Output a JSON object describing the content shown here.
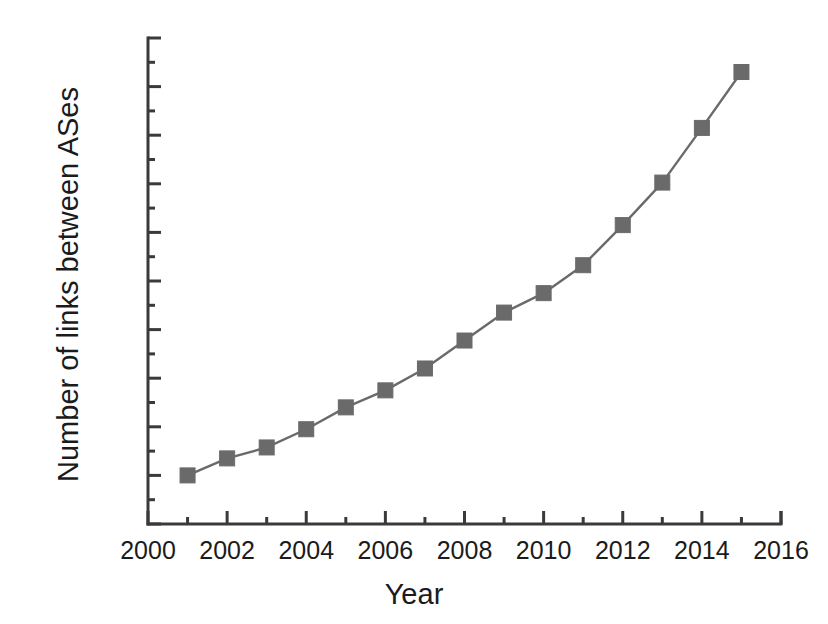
{
  "chart_data": {
    "type": "line",
    "title": "",
    "xlabel": "Year",
    "ylabel": "Number of links between ASes",
    "x": [
      2001,
      2002,
      2003,
      2004,
      2005,
      2006,
      2007,
      2008,
      2009,
      2010,
      2011,
      2012,
      2013,
      2014,
      2015
    ],
    "values": [
      20000,
      27000,
      31500,
      39000,
      48000,
      55000,
      64000,
      75500,
      87000,
      95000,
      106500,
      123000,
      140500,
      163000,
      186000
    ],
    "series": [
      {
        "name": "Number of links between ASes",
        "marker": "square",
        "marker_color": "#6a6a6a",
        "line_color": "#6a6a6a",
        "values": [
          20000,
          27000,
          31500,
          39000,
          48000,
          55000,
          64000,
          75500,
          87000,
          95000,
          106500,
          123000,
          140500,
          163000,
          186000
        ]
      }
    ],
    "xlim": [
      2000,
      2016
    ],
    "ylim": [
      0,
      200000
    ],
    "xticks": [
      2000,
      2002,
      2004,
      2006,
      2008,
      2010,
      2012,
      2014,
      2016
    ],
    "xtick_labels": [
      "2000",
      "2002",
      "2004",
      "2006",
      "2008",
      "2010",
      "2012",
      "2014",
      "2016"
    ],
    "xminor_ticks": [
      2001,
      2003,
      2005,
      2007,
      2009,
      2011,
      2013,
      2015
    ],
    "yticks": [
      0,
      20000,
      40000,
      60000,
      80000,
      100000,
      120000,
      140000,
      160000,
      180000,
      200000
    ],
    "ytick_labels": [
      "0",
      "20000",
      "40000",
      "60000",
      "80000",
      "100000",
      "120000",
      "140000",
      "160000",
      "180000",
      "200000"
    ],
    "yminor_ticks": [
      10000,
      30000,
      50000,
      70000,
      90000,
      110000,
      130000,
      150000,
      170000,
      190000
    ],
    "grid": false,
    "legend": null,
    "legend_position": "none",
    "axis_color": "#3a3a3a",
    "background_color": "#ffffff"
  },
  "axes": {
    "x_title": "Year",
    "y_title": "Number of links between ASes"
  }
}
